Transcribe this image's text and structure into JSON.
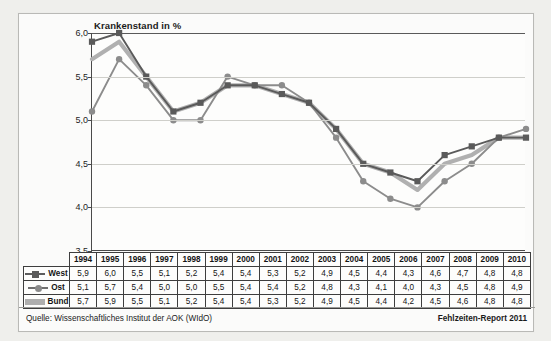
{
  "chart_data": {
    "type": "line",
    "title": "Krankenstand in %",
    "xlabel": "",
    "ylabel": "Krankenstand in %",
    "ylim": [
      3.5,
      6.0
    ],
    "ytick_labels": [
      "6,0",
      "5,5",
      "5,0",
      "4,5",
      "4,0",
      "3,5"
    ],
    "ytick_values": [
      6.0,
      5.5,
      5.0,
      4.5,
      4.0,
      3.5
    ],
    "grid": true,
    "legend_position": "table-left",
    "categories": [
      "1994",
      "1995",
      "1996",
      "1997",
      "1998",
      "1999",
      "2000",
      "2001",
      "2002",
      "2003",
      "2004",
      "2005",
      "2006",
      "2007",
      "2008",
      "2009",
      "2010"
    ],
    "series": [
      {
        "name": "West",
        "marker": "square",
        "color": "#5a5a5a",
        "values": [
          5.9,
          6.0,
          5.5,
          5.1,
          5.2,
          5.4,
          5.4,
          5.3,
          5.2,
          4.9,
          4.5,
          4.4,
          4.3,
          4.6,
          4.7,
          4.8,
          4.8
        ],
        "labels": [
          "5,9",
          "6,0",
          "5,5",
          "5,1",
          "5,2",
          "5,4",
          "5,4",
          "5,3",
          "5,2",
          "4,9",
          "4,5",
          "4,4",
          "4,3",
          "4,6",
          "4,7",
          "4,8",
          "4,8"
        ]
      },
      {
        "name": "Ost",
        "marker": "circle",
        "color": "#8c8c8c",
        "values": [
          5.1,
          5.7,
          5.4,
          5.0,
          5.0,
          5.5,
          5.4,
          5.4,
          5.2,
          4.8,
          4.3,
          4.1,
          4.0,
          4.3,
          4.5,
          4.8,
          4.9
        ],
        "labels": [
          "5,1",
          "5,7",
          "5,4",
          "5,0",
          "5,0",
          "5,5",
          "5,4",
          "5,4",
          "5,2",
          "4,8",
          "4,3",
          "4,1",
          "4,0",
          "4,3",
          "4,5",
          "4,8",
          "4,9"
        ]
      },
      {
        "name": "Bund",
        "marker": "none",
        "color": "#b0b0b0",
        "values": [
          5.7,
          5.9,
          5.5,
          5.1,
          5.2,
          5.4,
          5.4,
          5.3,
          5.2,
          4.9,
          4.5,
          4.4,
          4.2,
          4.5,
          4.6,
          4.8,
          4.8
        ],
        "labels": [
          "5,7",
          "5,9",
          "5,5",
          "5,1",
          "5,2",
          "5,4",
          "5,4",
          "5,3",
          "5,2",
          "4,9",
          "4,5",
          "4,4",
          "4,2",
          "4,5",
          "4,6",
          "4,8",
          "4,8"
        ]
      }
    ]
  },
  "footer": {
    "source": "Quelle: Wissenschaftliches Institut der AOK (WIdO)",
    "report": "Fehlzeiten-Report 2011"
  }
}
